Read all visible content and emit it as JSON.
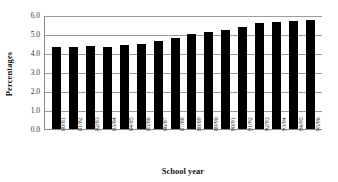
{
  "chart_data": {
    "type": "bar",
    "title": "",
    "xlabel": "School year",
    "ylabel": "Percentages",
    "categories": [
      "80/81",
      "81/82",
      "82/83",
      "83/84",
      "84/85",
      "85/86",
      "86/87",
      "87/88",
      "88/89",
      "89/90",
      "90/91",
      "91/92",
      "92/93",
      "93/94",
      "94/95",
      "95/96"
    ],
    "values": [
      4.3,
      4.3,
      4.35,
      4.3,
      4.4,
      4.5,
      4.65,
      4.8,
      5.0,
      5.1,
      5.2,
      5.35,
      5.6,
      5.65,
      5.7,
      5.75
    ],
    "ylim": [
      0.0,
      6.0
    ],
    "ytick_labels": [
      "6.0",
      "5.0",
      "4.0",
      "3.0",
      "2.0",
      "1.0",
      "0.0"
    ],
    "ytick_values": [
      6.0,
      5.0,
      4.0,
      3.0,
      2.0,
      1.0,
      0.0
    ],
    "grid": true,
    "legend": false,
    "bar_color": "#000000",
    "grid_color": "#9d9d9d",
    "axis_color": "#8a8a8a"
  }
}
